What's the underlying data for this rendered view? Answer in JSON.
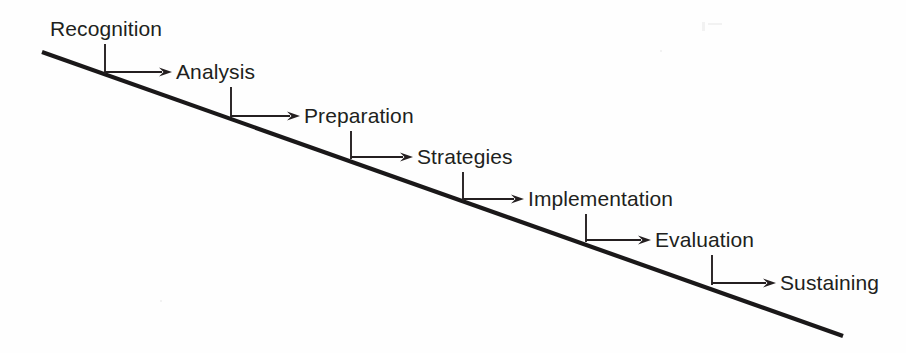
{
  "diagram": {
    "type": "descending-staircase-process-flow",
    "title": "",
    "background_color": "#fefefe",
    "ink_color": "#241f20",
    "label_color": "#211f20",
    "baseline": {
      "name": "diagonal-baseline",
      "x1": 42,
      "y1": 52,
      "x2": 843,
      "y2": 336
    },
    "stages": [
      {
        "id": "recognition",
        "label": "Recognition",
        "label_x": 50,
        "label_y": 36,
        "stem_x": 105,
        "stem_y_top": 44,
        "stem_y_bottom": 74,
        "arrow_y": 72,
        "arrow_x_start": 105,
        "arrow_x_end": 172,
        "has_incoming_arrow": false
      },
      {
        "id": "analysis",
        "label": "Analysis",
        "label_x": 176,
        "label_y": 79,
        "stem_x": 231,
        "stem_y_top": 87,
        "stem_y_bottom": 118,
        "arrow_y": 116,
        "arrow_x_start": 231,
        "arrow_x_end": 300,
        "has_incoming_arrow": true
      },
      {
        "id": "preparation",
        "label": "Preparation",
        "label_x": 304,
        "label_y": 123,
        "stem_x": 351,
        "stem_y_top": 131,
        "stem_y_bottom": 159,
        "arrow_y": 157,
        "arrow_x_start": 351,
        "arrow_x_end": 413,
        "has_incoming_arrow": true
      },
      {
        "id": "strategies",
        "label": "Strategies",
        "label_x": 417,
        "label_y": 164,
        "stem_x": 463,
        "stem_y_top": 172,
        "stem_y_bottom": 201,
        "arrow_y": 199,
        "arrow_x_start": 463,
        "arrow_x_end": 524,
        "has_incoming_arrow": true
      },
      {
        "id": "implementation",
        "label": "Implementation",
        "label_x": 528,
        "label_y": 206,
        "stem_x": 586,
        "stem_y_top": 214,
        "stem_y_bottom": 242,
        "arrow_y": 240,
        "arrow_x_start": 586,
        "arrow_x_end": 651,
        "has_incoming_arrow": true
      },
      {
        "id": "evaluation",
        "label": "Evaluation",
        "label_x": 655,
        "label_y": 247,
        "stem_x": 712,
        "stem_y_top": 255,
        "stem_y_bottom": 285,
        "arrow_y": 283,
        "arrow_x_start": 712,
        "arrow_x_end": 776,
        "has_incoming_arrow": true
      },
      {
        "id": "sustaining",
        "label": "Sustaining",
        "label_x": 780,
        "label_y": 290,
        "stem_x": null,
        "stem_y_top": null,
        "stem_y_bottom": null,
        "arrow_y": null,
        "arrow_x_start": null,
        "arrow_x_end": null,
        "has_incoming_arrow": true
      }
    ]
  }
}
